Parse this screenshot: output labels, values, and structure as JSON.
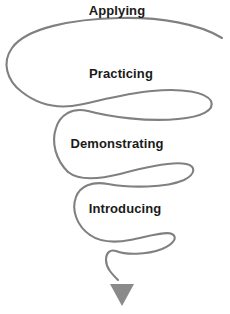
{
  "diagram": {
    "type": "spiral-funnel",
    "title": "",
    "orientation": "top-to-bottom",
    "stroke_color": "#808080",
    "arrow_color": "#8a8a8a",
    "label_color": "#1a1a1a",
    "background_color": "#ffffff",
    "stages": [
      {
        "id": "applying",
        "label": "Applying",
        "order": 1,
        "loop_width_px": 214,
        "loop_center_y_px": 50
      },
      {
        "id": "practicing",
        "label": "Practicing",
        "order": 2,
        "loop_width_px": 158,
        "loop_center_y_px": 105
      },
      {
        "id": "demonstrating",
        "label": "Demonstrating",
        "order": 3,
        "loop_width_px": 129,
        "loop_center_y_px": 175
      },
      {
        "id": "introducing",
        "label": "Introducing",
        "order": 4,
        "loop_width_px": 70,
        "loop_center_y_px": 240
      }
    ],
    "arrow": {
      "name": "downward-arrow",
      "tip_x_px": 122,
      "tip_y_px": 305
    }
  }
}
